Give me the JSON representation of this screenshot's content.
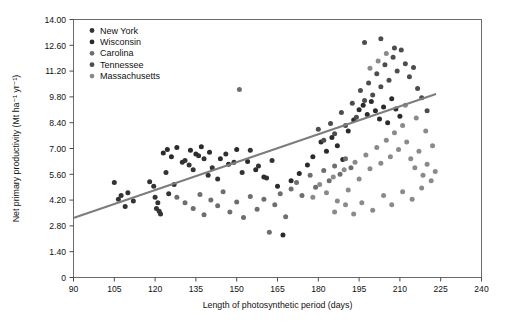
{
  "chart_data": {
    "type": "scatter",
    "title": "",
    "xlabel": "Length of photosynthetic period (days)",
    "ylabel": "Net primary productivity (Mt ha⁻¹ yr⁻¹)",
    "xlim": [
      90,
      240
    ],
    "ylim": [
      0,
      14.0
    ],
    "xticks": [
      90,
      105,
      120,
      135,
      150,
      165,
      180,
      195,
      210,
      225,
      240
    ],
    "xticklabels": [
      "90",
      "105",
      "120",
      "135",
      "150",
      "165",
      "180",
      "195",
      "210",
      "225",
      "240"
    ],
    "yticks": [
      0,
      1.4,
      2.8,
      4.2,
      5.6,
      7.0,
      8.4,
      9.8,
      11.2,
      12.6,
      14.0
    ],
    "yticklabels": [
      "0",
      "1.40",
      "2.80",
      "4.20",
      "5.60",
      "7.00",
      "8.40",
      "9.80",
      "11.20",
      "12.60",
      "14.00"
    ],
    "grid": false,
    "legend_position": "upper-left",
    "trendline": {
      "x": [
        90.5,
        223.0
      ],
      "y": [
        3.25,
        9.95
      ],
      "color": "#7d7d7d"
    },
    "series": [
      {
        "name": "New York",
        "color": "#333333",
        "points": [
          [
            105.0,
            5.15
          ],
          [
            106.5,
            4.25
          ],
          [
            107.5,
            4.45
          ],
          [
            109.0,
            3.85
          ],
          [
            110.0,
            4.6
          ],
          [
            112.0,
            4.15
          ],
          [
            118.0,
            5.2
          ],
          [
            119.5,
            4.95
          ],
          [
            120.0,
            4.35
          ],
          [
            120.5,
            3.75
          ],
          [
            121.0,
            4.05
          ],
          [
            121.5,
            3.6
          ],
          [
            122.0,
            3.45
          ],
          [
            124.0,
            5.7
          ],
          [
            125.0,
            4.55
          ],
          [
            127.0,
            5.05
          ],
          [
            130.0,
            6.25
          ],
          [
            131.0,
            6.35
          ],
          [
            132.5,
            6.1
          ],
          [
            134.0,
            5.85
          ],
          [
            136.0,
            6.6
          ],
          [
            138.0,
            6.45
          ],
          [
            139.5,
            5.55
          ],
          [
            141.0,
            5.95
          ],
          [
            143.0,
            5.35
          ],
          [
            146.0,
            6.7
          ],
          [
            149.0,
            6.25
          ],
          [
            152.0,
            5.7
          ],
          [
            155.0,
            6.9
          ],
          [
            158.0,
            6.05
          ],
          [
            161.0,
            5.4
          ],
          [
            163.0,
            6.35
          ]
        ]
      },
      {
        "name": "Wisconsin",
        "color": "#2b2b2b",
        "points": [
          [
            123.0,
            6.75
          ],
          [
            124.5,
            6.95
          ],
          [
            126.0,
            6.55
          ],
          [
            128.0,
            7.05
          ],
          [
            133.0,
            6.9
          ],
          [
            135.0,
            6.7
          ],
          [
            137.0,
            7.1
          ],
          [
            140.0,
            6.8
          ],
          [
            144.0,
            6.45
          ],
          [
            147.0,
            6.15
          ],
          [
            150.0,
            6.95
          ],
          [
            154.0,
            6.3
          ],
          [
            157.0,
            5.85
          ],
          [
            160.0,
            5.45
          ],
          [
            165.0,
            4.95
          ],
          [
            167.0,
            2.3
          ],
          [
            170.0,
            5.25
          ],
          [
            173.0,
            5.65
          ],
          [
            176.0,
            6.1
          ],
          [
            178.0,
            6.55
          ],
          [
            181.0,
            7.35
          ],
          [
            183.0,
            6.85
          ],
          [
            185.0,
            7.6
          ],
          [
            187.0,
            7.15
          ],
          [
            189.0,
            6.4
          ],
          [
            191.0,
            7.95
          ],
          [
            193.0,
            8.55
          ],
          [
            195.0,
            9.1
          ],
          [
            196.5,
            9.35
          ],
          [
            198.0,
            8.85
          ],
          [
            199.5,
            9.55
          ],
          [
            201.0,
            9.05
          ],
          [
            202.5,
            8.6
          ],
          [
            204.0,
            9.25
          ],
          [
            205.5,
            8.4
          ],
          [
            207.0,
            9.7
          ],
          [
            208.5,
            9.15
          ],
          [
            210.0,
            8.75
          ]
        ]
      },
      {
        "name": "Carolina",
        "color": "#6e6e6e",
        "points": [
          [
            128.0,
            4.35
          ],
          [
            131.0,
            4.05
          ],
          [
            134.0,
            3.75
          ],
          [
            136.5,
            4.5
          ],
          [
            138.0,
            3.4
          ],
          [
            140.5,
            4.2
          ],
          [
            143.0,
            3.9
          ],
          [
            145.0,
            4.65
          ],
          [
            147.5,
            3.55
          ],
          [
            150.0,
            4.1
          ],
          [
            151.0,
            10.2
          ],
          [
            152.5,
            3.25
          ],
          [
            155.0,
            4.4
          ],
          [
            157.5,
            3.7
          ],
          [
            160.0,
            4.25
          ],
          [
            162.0,
            2.45
          ],
          [
            164.0,
            3.95
          ],
          [
            166.0,
            4.55
          ],
          [
            168.0,
            3.3
          ],
          [
            170.0,
            4.8
          ],
          [
            172.0,
            5.15
          ],
          [
            174.0,
            4.45
          ],
          [
            177.0,
            5.55
          ],
          [
            179.0,
            4.9
          ],
          [
            182.0,
            5.8
          ],
          [
            184.0,
            5.25
          ],
          [
            186.0,
            6.05
          ],
          [
            188.0,
            5.6
          ],
          [
            190.0,
            6.45
          ],
          [
            192.0,
            5.95
          ]
        ]
      },
      {
        "name": "Tennessee",
        "color": "#4d4d4d",
        "points": [
          [
            180.0,
            8.05
          ],
          [
            182.0,
            7.45
          ],
          [
            184.5,
            8.35
          ],
          [
            186.0,
            7.8
          ],
          [
            188.5,
            8.95
          ],
          [
            190.0,
            8.25
          ],
          [
            192.5,
            9.45
          ],
          [
            194.0,
            8.7
          ],
          [
            195.5,
            10.15
          ],
          [
            197.0,
            9.6
          ],
          [
            198.5,
            10.55
          ],
          [
            200.0,
            9.9
          ],
          [
            201.5,
            11.05
          ],
          [
            203.0,
            10.35
          ],
          [
            204.5,
            11.55
          ],
          [
            206.0,
            10.7
          ],
          [
            207.5,
            11.95
          ],
          [
            209.0,
            11.2
          ],
          [
            210.5,
            12.35
          ],
          [
            212.0,
            11.6
          ],
          [
            213.5,
            10.9
          ],
          [
            215.0,
            11.4
          ],
          [
            216.5,
            10.25
          ],
          [
            218.0,
            9.75
          ],
          [
            220.0,
            9.05
          ],
          [
            197.0,
            12.75
          ],
          [
            203.0,
            12.95
          ],
          [
            208.0,
            12.45
          ]
        ]
      },
      {
        "name": "Massachusetts",
        "color": "#8a8a8a",
        "points": [
          [
            178.0,
            4.35
          ],
          [
            180.5,
            5.05
          ],
          [
            183.0,
            4.6
          ],
          [
            185.5,
            5.45
          ],
          [
            187.0,
            4.15
          ],
          [
            189.5,
            5.85
          ],
          [
            191.0,
            4.75
          ],
          [
            193.5,
            6.25
          ],
          [
            195.0,
            5.35
          ],
          [
            197.5,
            6.65
          ],
          [
            199.0,
            5.9
          ],
          [
            201.5,
            7.05
          ],
          [
            203.0,
            6.2
          ],
          [
            205.0,
            7.45
          ],
          [
            206.5,
            6.55
          ],
          [
            208.0,
            7.85
          ],
          [
            209.5,
            6.95
          ],
          [
            211.0,
            8.25
          ],
          [
            212.5,
            7.35
          ],
          [
            214.0,
            6.45
          ],
          [
            215.5,
            5.95
          ],
          [
            217.0,
            6.85
          ],
          [
            218.5,
            5.55
          ],
          [
            220.0,
            6.15
          ],
          [
            221.5,
            5.25
          ],
          [
            223.0,
            5.75
          ],
          [
            196.0,
            4.05
          ],
          [
            200.0,
            3.65
          ],
          [
            204.0,
            4.45
          ],
          [
            207.0,
            3.95
          ],
          [
            211.0,
            4.65
          ],
          [
            214.5,
            4.25
          ],
          [
            218.0,
            4.85
          ],
          [
            193.0,
            3.45
          ],
          [
            190.0,
            3.95
          ],
          [
            186.0,
            3.55
          ],
          [
            202.0,
            11.75
          ],
          [
            205.0,
            12.15
          ],
          [
            199.0,
            11.35
          ],
          [
            212.0,
            9.35
          ],
          [
            216.0,
            8.65
          ],
          [
            219.5,
            7.95
          ],
          [
            222.0,
            7.15
          ]
        ]
      }
    ]
  },
  "legend": {
    "entries": [
      "New York",
      "Wisconsin",
      "Carolina",
      "Tennessee",
      "Massachusetts"
    ]
  }
}
